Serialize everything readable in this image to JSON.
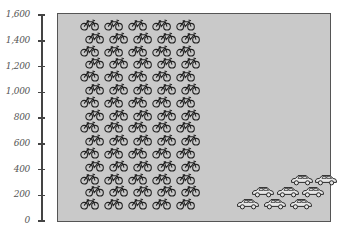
{
  "chart_data": {
    "type": "bar",
    "subtype": "pictograph",
    "title": "",
    "xlabel": "",
    "ylabel": "",
    "categories": [
      "Bicycles",
      "Cars"
    ],
    "values": [
      1500,
      300
    ],
    "icons": [
      "bicycle-icon",
      "car-icon"
    ],
    "icon_counts": [
      75,
      8
    ],
    "ylim": [
      0,
      1600
    ],
    "yticks": [
      0,
      200,
      400,
      600,
      800,
      1000,
      1200,
      1400,
      1600
    ],
    "ytick_labels": [
      "0",
      "200",
      "400",
      "600",
      "800",
      "1,000",
      "1,200",
      "1,400",
      "1,600"
    ],
    "grid": false,
    "legend": null
  },
  "colors": {
    "plot_background": "#c9c9c9",
    "frame": "#555555",
    "icon_stroke": "#222222",
    "axis": "#444444",
    "tick_label": "#555555"
  }
}
